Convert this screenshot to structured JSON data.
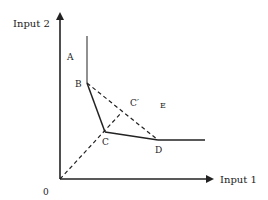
{
  "diagram": {
    "type": "isoquant",
    "axes": {
      "y_label": "Input 2",
      "x_label": "Input 1",
      "origin_label": "0"
    },
    "points": {
      "A": "A",
      "B": "B",
      "C": "C",
      "C_prime": "C′",
      "D": "D",
      "E": "E"
    },
    "segments": [
      {
        "from": "top",
        "to": "B",
        "style": "solid"
      },
      {
        "from": "B",
        "to": "C",
        "style": "solid"
      },
      {
        "from": "C",
        "to": "D",
        "style": "solid"
      },
      {
        "from": "D",
        "to": "right",
        "style": "solid"
      },
      {
        "from": "B",
        "to": "D",
        "style": "dashed"
      },
      {
        "from": "0",
        "to": "C′",
        "style": "dashed"
      }
    ],
    "colors": {
      "line": "#222222",
      "background": "#ffffff"
    }
  }
}
